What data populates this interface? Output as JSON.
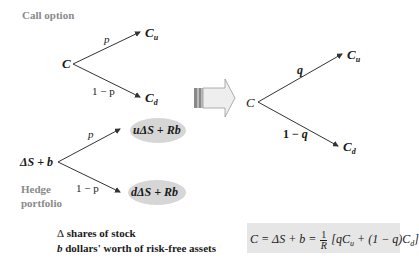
{
  "call_option": {
    "label": "Call option",
    "root": "C",
    "up_prob": "p",
    "down_prob": "1 − p",
    "up_node": "C",
    "up_sub": "u",
    "down_node": "C",
    "down_sub": "d"
  },
  "hedge_portfolio": {
    "label_line1": "Hedge",
    "label_line2": "portfolio",
    "root": "ΔS + b",
    "up_prob": "p",
    "down_prob": "1 − p",
    "up_node": "uΔS + Rb",
    "down_node": "dΔS + Rb"
  },
  "risk_neutral": {
    "root": "C",
    "up_prob": "q",
    "down_prob": "1 − q",
    "up_node": "C",
    "up_sub": "u",
    "down_node": "C",
    "down_sub": "d"
  },
  "legend": {
    "line1_symbol": "Δ",
    "line1_text": " shares of stock",
    "line2_symbol": "b",
    "line2_text": " dollars' worth of risk-free assets"
  },
  "formula": {
    "lhs": "C = ΔS + b = ",
    "frac_num": "1",
    "frac_den": "R",
    "rhs_open": " [qC",
    "rhs_sub_u": "u",
    "rhs_mid": " + (1 − q)C",
    "rhs_sub_d": "d",
    "rhs_close": "]"
  },
  "colors": {
    "gray_label": "#8a8a8a",
    "ellipse_fill": "#d6d6d6",
    "formula_bg": "#e6e6e6",
    "arrow_fill": "#eeeeee",
    "line": "#333333"
  }
}
